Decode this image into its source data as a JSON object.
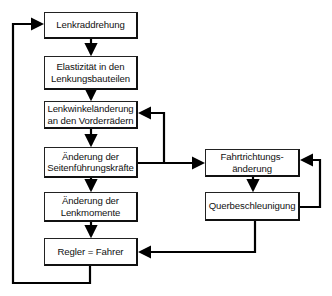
{
  "diagram": {
    "left_column": [
      {
        "id": "lenkraddrehung",
        "lines": [
          "Lenkraddrehung"
        ]
      },
      {
        "id": "elastizitaet",
        "lines": [
          "Elastizität in den",
          "Lenkungsbauteilen"
        ]
      },
      {
        "id": "lenkwinkelaenderung",
        "lines": [
          "Lenkwinkeländerung",
          "an den Vorderrädern"
        ]
      },
      {
        "id": "seitenfuehrungskraefte",
        "lines": [
          "Änderung der",
          "Seitenführungskräfte"
        ]
      },
      {
        "id": "lenkmomente",
        "lines": [
          "Änderung der",
          "Lenkmomente"
        ]
      },
      {
        "id": "regler",
        "lines": [
          "Regler = Fahrer"
        ]
      }
    ],
    "right_column": [
      {
        "id": "fahrtrichtungsaenderung",
        "lines": [
          "Fahrtrichtungs-",
          "änderung"
        ]
      },
      {
        "id": "querbeschleunigung",
        "lines": [
          "Querbeschleunigung"
        ]
      }
    ],
    "connections": [
      {
        "from": "lenkraddrehung",
        "to": "elastizitaet"
      },
      {
        "from": "elastizitaet",
        "to": "lenkwinkelaenderung"
      },
      {
        "from": "lenkwinkelaenderung",
        "to": "seitenfuehrungskraefte"
      },
      {
        "from": "seitenfuehrungskraefte",
        "to": "lenkmomente"
      },
      {
        "from": "lenkmomente",
        "to": "regler"
      },
      {
        "from": "regler",
        "to": "lenkraddrehung",
        "type": "feedback-left"
      },
      {
        "from": "seitenfuehrungskraefte",
        "to": "fahrtrichtungsaenderung"
      },
      {
        "from": "seitenfuehrungskraefte",
        "to": "lenkwinkelaenderung",
        "type": "feedback"
      },
      {
        "from": "fahrtrichtungsaenderung",
        "to": "querbeschleunigung"
      },
      {
        "from": "querbeschleunigung",
        "to": "fahrtrichtungsaenderung",
        "type": "feedback-right"
      },
      {
        "from": "querbeschleunigung",
        "to": "regler"
      }
    ]
  }
}
